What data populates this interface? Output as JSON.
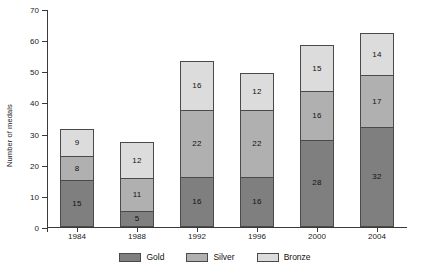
{
  "chart_data": {
    "type": "bar",
    "stacked": true,
    "title": "",
    "xlabel": "",
    "ylabel": "Number of medals",
    "categories": [
      "1984",
      "1988",
      "1992",
      "1996",
      "2000",
      "2004"
    ],
    "series": [
      {
        "name": "Gold",
        "color": "#7f7f7f",
        "values": [
          15,
          5,
          16,
          16,
          28,
          32
        ]
      },
      {
        "name": "Silver",
        "color": "#b0b0b0",
        "values": [
          8,
          11,
          22,
          22,
          16,
          17
        ]
      },
      {
        "name": "Bronze",
        "color": "#dcdcdc",
        "values": [
          9,
          12,
          16,
          12,
          15,
          14
        ]
      }
    ],
    "totals": [
      32,
      28,
      54,
      50,
      59,
      63
    ],
    "ylim": [
      0,
      70
    ],
    "yticks": [
      0,
      10,
      20,
      30,
      40,
      50,
      60,
      70
    ],
    "ytick_labels": [
      "0",
      "10",
      "20",
      "30",
      "40",
      "50",
      "60",
      "70"
    ],
    "grid": false,
    "legend_position": "bottom"
  },
  "legend": {
    "items": [
      {
        "label": "Gold"
      },
      {
        "label": "Silver"
      },
      {
        "label": "Bronze"
      }
    ]
  }
}
